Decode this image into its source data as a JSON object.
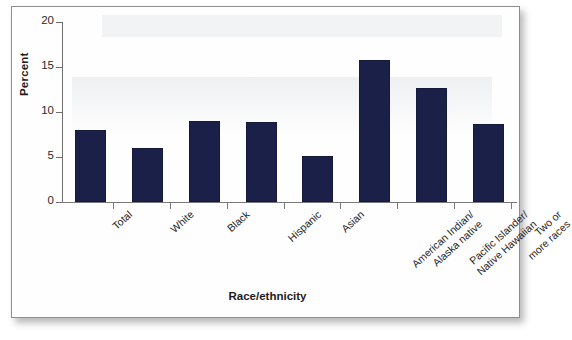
{
  "figure": {
    "background_color": "#ffffff",
    "frame_border_color": "#8e8e8e",
    "bar_color": "#1b2048",
    "axis_color": "#6f6f6f"
  },
  "axes": {
    "y_title": "Percent",
    "x_title": "Race/ethnicity",
    "y_ticks": [
      "0",
      "5",
      "10",
      "15",
      "20"
    ]
  },
  "chart_data": {
    "type": "bar",
    "title": "",
    "subtitle": "",
    "xlabel": "Race/ethnicity",
    "ylabel": "Percent",
    "ylim": [
      0,
      20
    ],
    "yticks": [
      0,
      5,
      10,
      15,
      20
    ],
    "grid": false,
    "legend": "none",
    "bar_color": "#1b2048",
    "categories": [
      "Total",
      "White",
      "Black",
      "Hispanic",
      "Asian",
      "American Indian/ Alaska native",
      "Pacific Islander/ Native Hawaiian",
      "Two or more races"
    ],
    "category_lines": [
      [
        "Total"
      ],
      [
        "White"
      ],
      [
        "Black"
      ],
      [
        "Hispanic"
      ],
      [
        "Asian"
      ],
      [
        "American Indian/",
        "Alaska native"
      ],
      [
        "Pacific Islander/",
        "Native Hawaiian"
      ],
      [
        "Two or",
        "more races"
      ]
    ],
    "values": [
      8.0,
      6.0,
      9.0,
      8.9,
      5.1,
      15.8,
      12.7,
      8.7
    ]
  }
}
